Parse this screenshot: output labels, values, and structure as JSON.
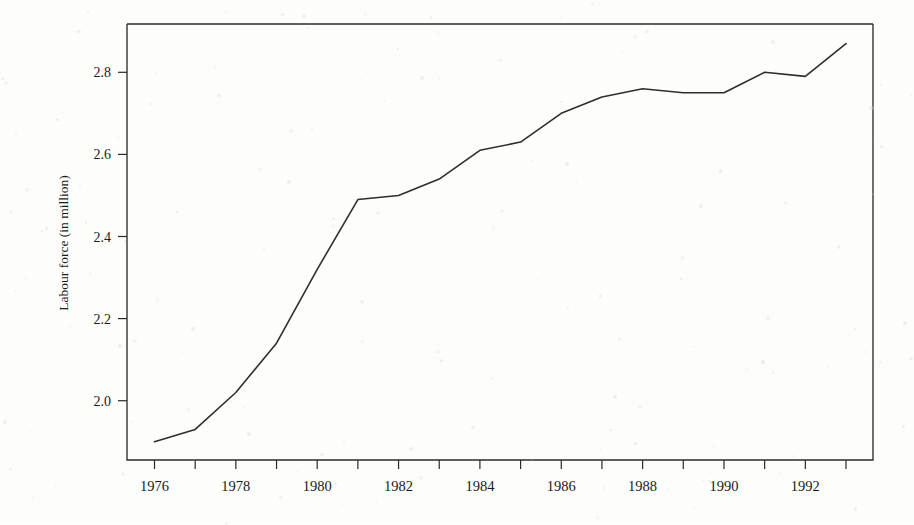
{
  "chart_data": {
    "type": "line",
    "title": "",
    "xlabel": "",
    "ylabel": "Labour force (in million)",
    "x": [
      1976,
      1977,
      1978,
      1979,
      1980,
      1981,
      1982,
      1983,
      1984,
      1985,
      1986,
      1987,
      1988,
      1989,
      1990,
      1991,
      1992,
      1993
    ],
    "values": [
      1.9,
      1.93,
      2.02,
      2.14,
      2.32,
      2.49,
      2.5,
      2.54,
      2.61,
      2.63,
      2.7,
      2.74,
      2.76,
      2.75,
      2.75,
      2.8,
      2.79,
      2.87
    ],
    "series": [
      {
        "name": "Labour force",
        "values": [
          1.9,
          1.93,
          2.02,
          2.14,
          2.32,
          2.49,
          2.5,
          2.54,
          2.61,
          2.63,
          2.7,
          2.74,
          2.76,
          2.75,
          2.75,
          2.8,
          2.79,
          2.87
        ]
      }
    ],
    "xlim": [
      1976,
      1993
    ],
    "ylim": [
      1.88,
      2.89
    ],
    "ytick_values": [
      2.0,
      2.2,
      2.4,
      2.6,
      2.8
    ],
    "ytick_labels": [
      "2.0",
      "2.2",
      "2.4",
      "2.6",
      "2.8"
    ],
    "xtick_values": [
      1976,
      1977,
      1978,
      1979,
      1980,
      1981,
      1982,
      1983,
      1984,
      1985,
      1986,
      1987,
      1988,
      1989,
      1990,
      1991,
      1992,
      1993
    ],
    "xtick_labels": [
      "1976",
      "",
      "1978",
      "",
      "1980",
      "",
      "1982",
      "",
      "1984",
      "",
      "1986",
      "",
      "1988",
      "",
      "1990",
      "",
      "1992",
      ""
    ],
    "xtick_labels_shown": [
      "1976",
      "1978",
      "1980",
      "1982",
      "1984",
      "1986",
      "1988",
      "1990",
      "1992"
    ],
    "grid": false,
    "legend": false,
    "legend_position": "none",
    "line_color": "#2e2e2e",
    "axis_color": "#2b2b2b",
    "background_color": "#fdfdfc"
  }
}
